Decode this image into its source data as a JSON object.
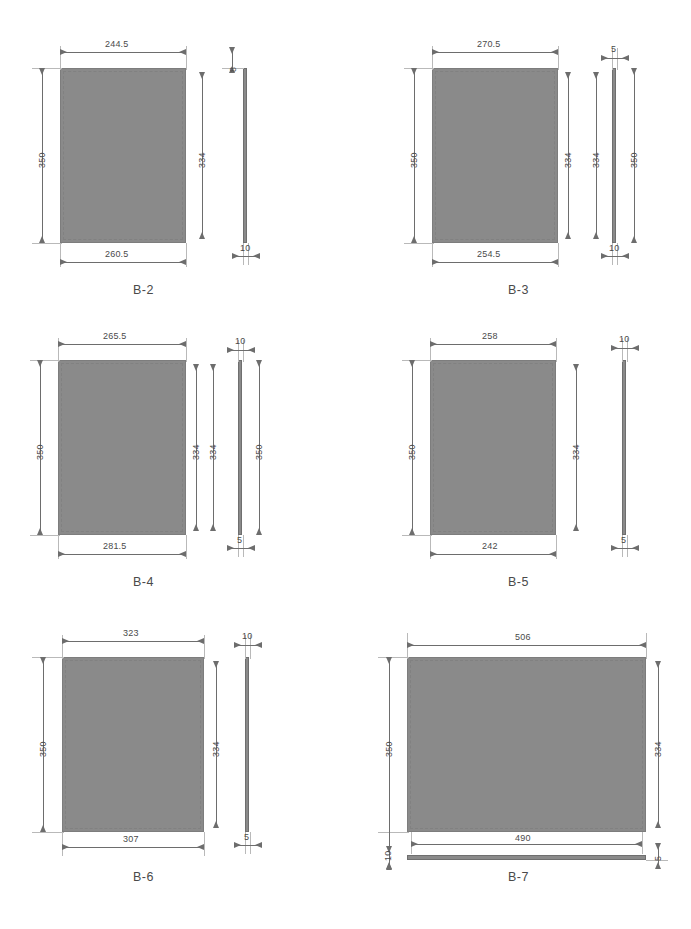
{
  "drawing": {
    "title": "Panel part dimension sheet",
    "units": "mm",
    "fill_color": "#8a8a8a",
    "line_color": "#6d6d6d",
    "ext_line_color": "#b9b9b9",
    "text_color": "#4a4a4a",
    "background": "#ffffff"
  },
  "parts": [
    {
      "id": "b2",
      "label": "B-2",
      "front": {
        "top_width": "244.5",
        "bottom_width": "260.5",
        "left_height": "350",
        "right_height": "334"
      },
      "side": {
        "top_thickness": "8",
        "bottom_thickness": "10",
        "left_height": "",
        "right_height": ""
      }
    },
    {
      "id": "b3",
      "label": "B-3",
      "front": {
        "top_width": "270.5",
        "bottom_width": "254.5",
        "left_height": "350",
        "right_height": "334"
      },
      "side": {
        "top_thickness": "5",
        "bottom_thickness": "10",
        "left_height": "334",
        "right_height": "350"
      }
    },
    {
      "id": "b4",
      "label": "B-4",
      "front": {
        "top_width": "265.5",
        "bottom_width": "281.5",
        "left_height": "350",
        "right_height": "334"
      },
      "side": {
        "top_thickness": "10",
        "bottom_thickness": "5",
        "left_height": "334",
        "right_height": "350"
      }
    },
    {
      "id": "b5",
      "label": "B-5",
      "front": {
        "top_width": "258",
        "bottom_width": "242",
        "left_height": "350",
        "right_height": "334"
      },
      "side": {
        "top_thickness": "10",
        "bottom_thickness": "5",
        "left_height": "",
        "right_height": ""
      }
    },
    {
      "id": "b6",
      "label": "B-6",
      "front": {
        "top_width": "323",
        "bottom_width": "307",
        "left_height": "350",
        "right_height": "334"
      },
      "side": {
        "top_thickness": "10",
        "bottom_thickness": "5",
        "left_height": "",
        "right_height": ""
      }
    },
    {
      "id": "b7",
      "label": "B-7",
      "front": {
        "top_width": "506",
        "bottom_width": "490",
        "left_height": "350",
        "right_height": "334"
      },
      "side": {
        "top_thickness": "10",
        "bottom_thickness": "5",
        "left_height": "",
        "right_height": ""
      }
    }
  ]
}
